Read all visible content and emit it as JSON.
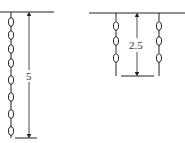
{
  "diagram": {
    "left": {
      "dimension_label": "5",
      "chain_links": 7
    },
    "right": {
      "dimension_label": "2.5",
      "chain_links_per_chain": 3,
      "chain_count": 2
    },
    "colors": {
      "stroke": "#222222",
      "background": "#ffffff"
    }
  }
}
